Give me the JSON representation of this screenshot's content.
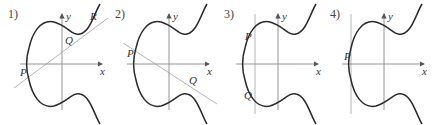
{
  "figure": {
    "panels": [
      {
        "number": "1)",
        "x_label": "x",
        "y_label": "y",
        "points": [
          "P",
          "Q",
          "R"
        ],
        "line": "secant through P, Q, R"
      },
      {
        "number": "2)",
        "x_label": "x",
        "y_label": "y",
        "points": [
          "P",
          "Q"
        ],
        "line": "tangent at Q passing through P"
      },
      {
        "number": "3)",
        "x_label": "x",
        "y_label": "y",
        "points": [
          "P",
          "Q"
        ],
        "line": "vertical line through P and Q"
      },
      {
        "number": "4)",
        "x_label": "x",
        "y_label": "y",
        "points": [
          "P"
        ],
        "line": "vertical tangent at P"
      }
    ],
    "colors": {
      "curve": "#2a2a2a",
      "axis": "#888888",
      "line": "#b5b5b5"
    }
  }
}
